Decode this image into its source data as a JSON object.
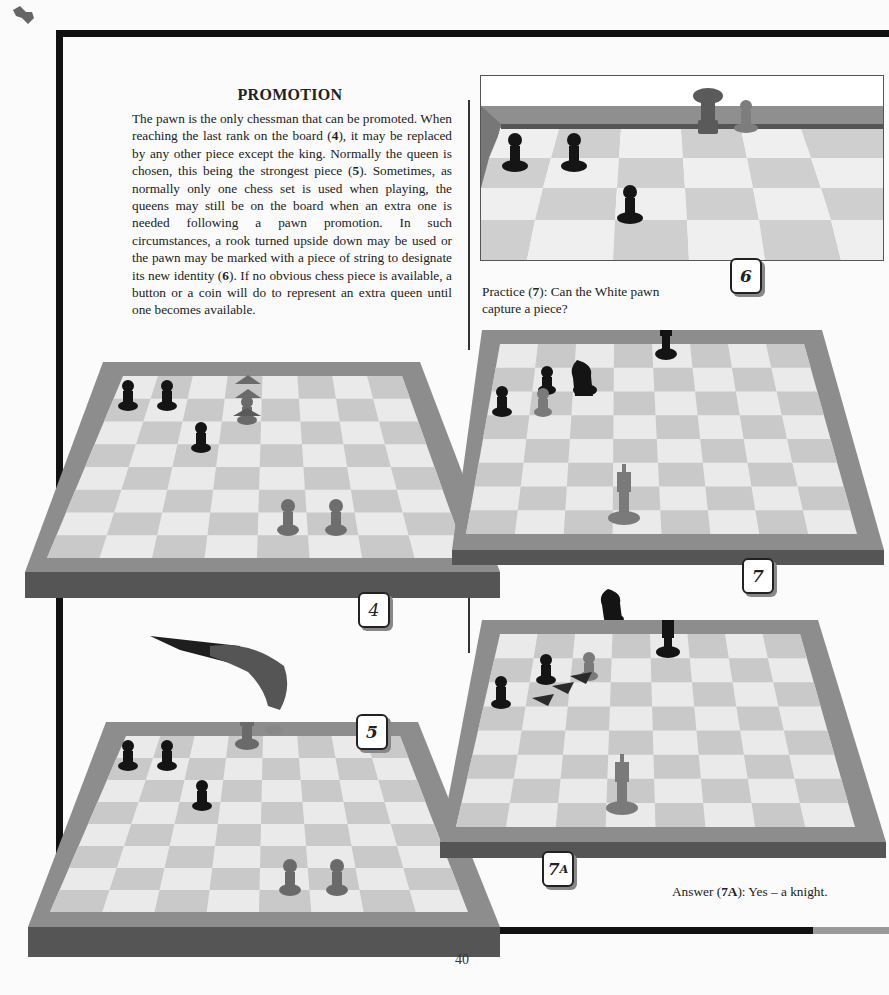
{
  "page": {
    "number": "40",
    "section_title": "PROMOTION"
  },
  "intro": {
    "paragraph": "The pawn is the only chessman that can be promoted. When reaching the last rank on the board (4), it may be replaced by any other piece except the king. Normally the queen is chosen, this being the strongest piece (5). Sometimes, as normally only one chess set is used when playing, the queens may still be on the board when an extra one is needed following a pawn promotion. In such circumstances, a rook turned upside down may be used or the pawn may be marked with a piece of string to designate its new identity (6). If no obvious chess piece is available, a button or a coin will do to represent an extra queen until one becomes available.",
    "parts": [
      {
        "t": "The pawn is the only chessman that can be promoted. When reaching the last rank on the board ("
      },
      {
        "b": "4"
      },
      {
        "t": "), it may be replaced by any other piece except the king. Normally the queen is chosen, this being the strongest piece ("
      },
      {
        "b": "5"
      },
      {
        "t": "). Sometimes, as normally only one chess set is used when playing, the queens may still be on the board when an extra one is needed following a pawn promotion. In such circumstances, a rook turned upside down may be used or the pawn may be marked with a piece of string to designate its new identity ("
      },
      {
        "b": "6"
      },
      {
        "t": "). If no obvious chess piece is available, a button or a coin will do to represent an extra queen until one becomes available."
      }
    ]
  },
  "practice": {
    "prefix": "Practice (",
    "ref": "7",
    "suffix": "): Can the White pawn capture a piece?"
  },
  "answer": {
    "prefix": "Answer (",
    "ref": "7A",
    "suffix": "): Yes – a knight."
  },
  "figures": [
    {
      "id": "4",
      "label": "4",
      "description": "Board with white pawn advancing to last rank (arrows up)",
      "pieces": [
        "black pawn",
        "black pawn",
        "black pawn",
        "white pawn (advancing)",
        "white pawn",
        "white pawn"
      ]
    },
    {
      "id": "5",
      "label": "5",
      "description": "Hand replacing promoted pawn with a queen",
      "pieces": [
        "black pawn",
        "black pawn",
        "black pawn",
        "white queen",
        "white pawn (lifted)",
        "white pawn",
        "white pawn"
      ]
    },
    {
      "id": "6",
      "label": "6",
      "description": "Upside-down rook used as queen",
      "pieces": [
        "black pawn",
        "black pawn",
        "black pawn",
        "inverted rook",
        "white pawn"
      ]
    },
    {
      "id": "7",
      "label": "7",
      "description": "Practice position",
      "pieces": [
        "black king",
        "black knight",
        "black pawn",
        "black pawn",
        "white pawn",
        "white king"
      ]
    },
    {
      "id": "7A",
      "label_main": "7",
      "label_sub": "A",
      "description": "Answer: pawn captures knight (arrows)",
      "pieces": [
        "black knight (captured, off board)",
        "black king",
        "black pawn",
        "black pawn",
        "white pawn",
        "white king"
      ]
    }
  ],
  "colors": {
    "frame_wood": "#8a8a8a",
    "frame_dark": "#555555",
    "light_square": "#ececec",
    "dark_square": "#c9c9c9",
    "page_rule": "#111111",
    "page_rule_grey": "#9a9a9a"
  }
}
